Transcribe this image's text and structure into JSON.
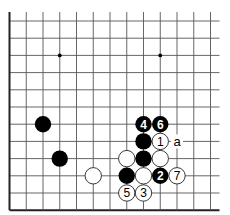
{
  "diagram": {
    "type": "go-board-partial",
    "visible_columns": 13,
    "visible_rows": 12,
    "edges": {
      "left": true,
      "bottom": true,
      "top": false,
      "right": false
    },
    "star_points": [
      {
        "col": 3,
        "row": 2
      },
      {
        "col": 9,
        "row": 2
      }
    ],
    "stones": [
      {
        "col": 2,
        "row": 6,
        "color": "black",
        "label": ""
      },
      {
        "col": 3,
        "row": 8,
        "color": "black",
        "label": ""
      },
      {
        "col": 5,
        "row": 9,
        "color": "white",
        "label": ""
      },
      {
        "col": 8,
        "row": 6,
        "color": "black",
        "label": "4"
      },
      {
        "col": 9,
        "row": 6,
        "color": "black",
        "label": "6"
      },
      {
        "col": 8,
        "row": 7,
        "color": "black",
        "label": ""
      },
      {
        "col": 9,
        "row": 7,
        "color": "white",
        "label": "1"
      },
      {
        "col": 7,
        "row": 8,
        "color": "white",
        "label": ""
      },
      {
        "col": 8,
        "row": 8,
        "color": "black",
        "label": ""
      },
      {
        "col": 9,
        "row": 8,
        "color": "white",
        "label": ""
      },
      {
        "col": 7,
        "row": 9,
        "color": "black",
        "label": ""
      },
      {
        "col": 8,
        "row": 9,
        "color": "white",
        "label": ""
      },
      {
        "col": 9,
        "row": 9,
        "color": "black",
        "label": "2"
      },
      {
        "col": 10,
        "row": 9,
        "color": "white",
        "label": "7"
      },
      {
        "col": 7,
        "row": 10,
        "color": "white",
        "label": "5"
      },
      {
        "col": 8,
        "row": 10,
        "color": "white",
        "label": "3"
      }
    ],
    "point_labels": [
      {
        "col": 10,
        "row": 7,
        "text": "a"
      }
    ]
  }
}
